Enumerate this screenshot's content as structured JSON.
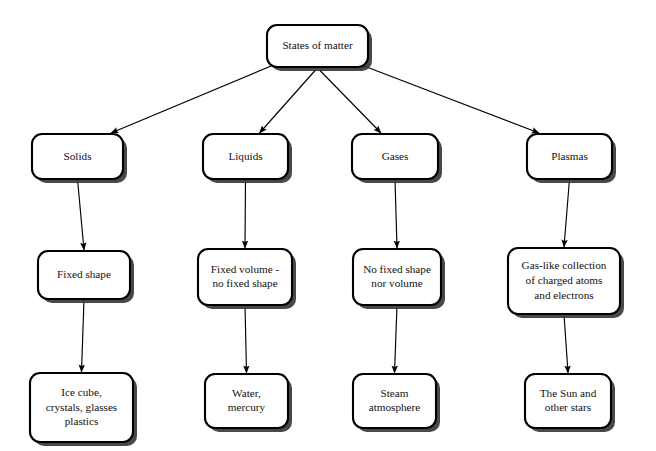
{
  "diagram": {
    "title": "States of matter",
    "type": "flowchart",
    "background_color": "#ffffff",
    "box_fill": "#ffffff",
    "box_border_color": "#000000",
    "text_color": "#111111",
    "shadow_color": "#3a3a3a",
    "root": {
      "id": "states-of-matter",
      "label": "States of matter",
      "lines": [
        "States of matter"
      ],
      "x": 267,
      "y": 25,
      "w": 101,
      "h": 42
    },
    "branches": [
      {
        "id": "solids",
        "state": {
          "label": "Solids",
          "lines": [
            "Solids"
          ],
          "x": 32,
          "y": 134,
          "w": 91,
          "h": 45
        },
        "property": {
          "label": "Fixed shape",
          "lines": [
            "Fixed shape"
          ],
          "x": 38,
          "y": 251,
          "w": 92,
          "h": 48
        },
        "example": {
          "label": "Ice cube, crystals, glasses plastics",
          "lines": [
            "Ice cube,",
            "crystals, glasses",
            "plastics"
          ],
          "x": 30,
          "y": 373,
          "w": 103,
          "h": 69
        }
      },
      {
        "id": "liquids",
        "state": {
          "label": "Liquids",
          "lines": [
            "Liquids"
          ],
          "x": 203,
          "y": 134,
          "w": 85,
          "h": 45
        },
        "property": {
          "label": "Fixed volume - no fixed shape",
          "lines": [
            "Fixed volume -",
            "no fixed shape"
          ],
          "x": 198,
          "y": 249,
          "w": 94,
          "h": 56
        },
        "example": {
          "label": "Water, mercury",
          "lines": [
            "Water,",
            "mercury"
          ],
          "x": 205,
          "y": 374,
          "w": 83,
          "h": 54
        }
      },
      {
        "id": "gases",
        "state": {
          "label": "Gases",
          "lines": [
            "Gases"
          ],
          "x": 352,
          "y": 134,
          "w": 86,
          "h": 45
        },
        "property": {
          "label": "No fixed shape nor volume",
          "lines": [
            "No fixed shape",
            "nor volume"
          ],
          "x": 353,
          "y": 249,
          "w": 88,
          "h": 56
        },
        "example": {
          "label": "Steam atmosphere",
          "lines": [
            "Steam",
            "atmosphere"
          ],
          "x": 353,
          "y": 374,
          "w": 83,
          "h": 54
        }
      },
      {
        "id": "plasmas",
        "state": {
          "label": "Plasmas",
          "lines": [
            "Plasmas"
          ],
          "x": 527,
          "y": 134,
          "w": 85,
          "h": 45
        },
        "property": {
          "label": "Gas-like collection of charged atoms and electrons",
          "lines": [
            "Gas-like collection",
            "of charged atoms",
            "and electrons"
          ],
          "x": 508,
          "y": 248,
          "w": 112,
          "h": 66
        },
        "example": {
          "label": "The Sun and other stars",
          "lines": [
            "The Sun and",
            "other stars"
          ],
          "x": 525,
          "y": 374,
          "w": 86,
          "h": 54
        }
      }
    ]
  }
}
